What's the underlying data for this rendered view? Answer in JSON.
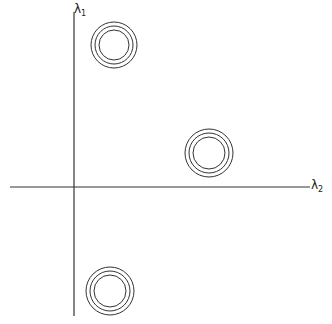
{
  "diagram": {
    "line_color": "#333333",
    "axes": {
      "vertical": {
        "symbol": "λ",
        "subscript": "1",
        "x": 74,
        "y1": 12,
        "y2": 316
      },
      "horizontal": {
        "symbol": "λ",
        "subscript": "2",
        "y": 187,
        "x1": 10,
        "x2": 310
      }
    },
    "clusters": [
      {
        "name": "upper-left",
        "cx": 114,
        "cy": 45,
        "radii": [
          23,
          19,
          15
        ]
      },
      {
        "name": "right",
        "cx": 209,
        "cy": 153,
        "radii": [
          24,
          20,
          16
        ]
      },
      {
        "name": "lower-left",
        "cx": 110,
        "cy": 291,
        "radii": [
          24,
          20,
          16
        ]
      }
    ]
  }
}
